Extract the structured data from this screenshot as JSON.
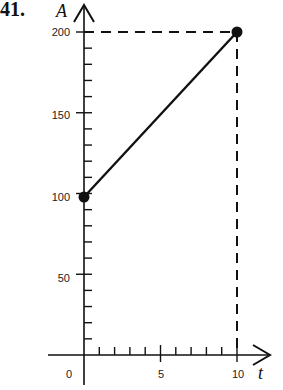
{
  "problem_number": "41.",
  "chart_data": {
    "type": "line",
    "title": "",
    "xlabel": "t",
    "ylabel": "A",
    "x": [
      0,
      10
    ],
    "series": [
      {
        "name": "A(t)",
        "values": [
          100,
          200
        ]
      }
    ],
    "points": [
      {
        "t": 0,
        "A": 100
      },
      {
        "t": 10,
        "A": 200
      }
    ],
    "xlim": [
      0,
      10
    ],
    "ylim": [
      0,
      200
    ],
    "x_ticks": [
      0,
      5,
      10
    ],
    "y_ticks": [
      50,
      100,
      150,
      200
    ],
    "minor_x_step": 1,
    "minor_y_step": 10,
    "grid": false,
    "annotations": [
      "dashed guide lines from (10,200) to both axes"
    ]
  },
  "labels": {
    "x0": "0",
    "x5": "5",
    "x10": "10",
    "y50": "50",
    "y100": "100",
    "y150": "150",
    "y200": "200",
    "xname": "t",
    "yname": "A"
  },
  "colors": {
    "ink": "#111111"
  }
}
